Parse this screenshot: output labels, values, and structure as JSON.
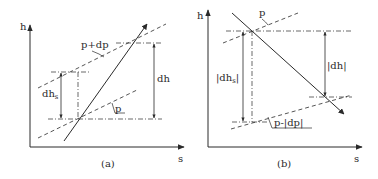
{
  "diagram": {
    "colors": {
      "ink": "#2a2a2a",
      "background": "#ffffff"
    },
    "panel_a": {
      "caption": "(a)",
      "axis_y_label": "h",
      "axis_x_label": "s",
      "isobar_upper_label": "p+dp",
      "isobar_lower_label": "p",
      "dh_s_label": "dh",
      "dh_s_sub": "s",
      "dh_label": "dh"
    },
    "panel_b": {
      "caption": "(b)",
      "axis_y_label": "h",
      "axis_x_label": "s",
      "isobar_upper_label": "p",
      "isobar_lower_label": "p-|dp|",
      "dh_s_label": "|dh",
      "dh_s_sub": "s",
      "dh_s_close": "|",
      "dh_label": "|dh|"
    }
  }
}
